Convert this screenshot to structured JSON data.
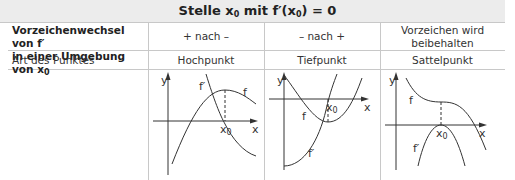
{
  "title": {
    "prefix": "Stelle x",
    "sub": "0",
    "mid": " mit f′(x",
    "sub2": "0",
    "suffix": ") = 0"
  },
  "rows": [
    {
      "label_line1": "Vorzeichenwechsel von f′",
      "label_line2_prefix": "in einer Umgebung von x",
      "label_line2_sub": "0",
      "cells": [
        "+ nach –",
        "– nach +",
        "Vorzeichen wird",
        "beibehalten"
      ]
    },
    {
      "label": "Art des Punktes",
      "cells": [
        "Hochpunkt",
        "Tiefpunkt",
        "Sattelpunkt"
      ]
    }
  ],
  "graphs": [
    {
      "name": "hochpunkt",
      "labels": {
        "y": "y",
        "x": "x",
        "f": "f",
        "fprime": "f′",
        "x0": "x",
        "x0_sub": "0"
      }
    },
    {
      "name": "tiefpunkt",
      "labels": {
        "y": "y",
        "x": "x",
        "f": "f",
        "fprime": "f′",
        "x0": "x",
        "x0_sub": "0"
      }
    },
    {
      "name": "sattelpunkt",
      "labels": {
        "y": "y",
        "x": "x",
        "f": "f",
        "fprime": "f′",
        "x0": "x",
        "x0_sub": "0"
      }
    }
  ]
}
